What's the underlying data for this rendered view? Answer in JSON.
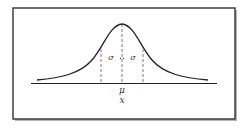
{
  "diagram": {
    "type": "normal-distribution",
    "labels": {
      "mean": "μ",
      "axis": "x",
      "sigma_left": "σ",
      "sigma_right": "σ"
    },
    "colors": {
      "curve": "#222222",
      "dashed": "#555555",
      "frame": "#333333",
      "shadow": "#9a9a9a"
    }
  }
}
